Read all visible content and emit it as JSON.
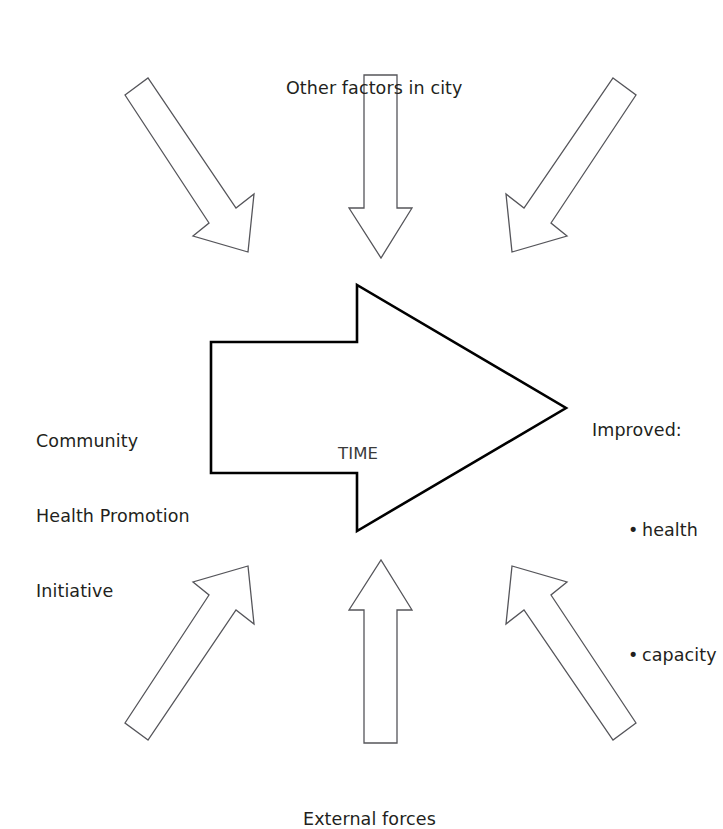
{
  "diagram": {
    "stroke_color_main": "#000000",
    "stroke_color_outer": "#55555a",
    "background": "#ffffff",
    "text_color": "#231f20",
    "labels": {
      "top": "Other factors in city",
      "bottom": "External forces",
      "center": "TIME",
      "left": {
        "line1": "Community",
        "line2": "Health Promotion",
        "line3": "Initiative"
      },
      "right": {
        "heading": "Improved:",
        "bullet_symbol": "•",
        "items": [
          "health",
          "capacity"
        ]
      }
    },
    "shapes": {
      "main_arrow": {
        "name": "time-arrow",
        "direction": "right",
        "points": "211,342 357,342 357,285 566,408 357,531 357,473 211,473"
      },
      "arrow_top_left": {
        "name": "arrow-top-left",
        "direction": "down-right",
        "points": "125,95 148,78 236,208 254,194 248,252 193,236 209,223"
      },
      "arrow_top_center": {
        "name": "arrow-top-center",
        "direction": "down",
        "points": "364,75 397,75 397,208 412,208 381,258 349,208 364,208"
      },
      "arrow_top_right": {
        "name": "arrow-top-right",
        "direction": "down-left",
        "points": "613,78 636,95 551,223 567,236 512,252 506,194 524,208"
      },
      "arrow_bottom_left": {
        "name": "arrow-bottom-left",
        "direction": "up-right",
        "points": "148,740 125,723 209,595 193,582 248,566 254,624 236,610"
      },
      "arrow_bottom_center": {
        "name": "arrow-bottom-center",
        "direction": "up",
        "points": "397,743 364,743 364,610 349,610 381,560 412,610 397,610"
      },
      "arrow_bottom_right": {
        "name": "arrow-bottom-right",
        "direction": "up-left",
        "points": "636,723 613,740 524,610 506,624 512,566 567,582 551,595"
      }
    }
  }
}
